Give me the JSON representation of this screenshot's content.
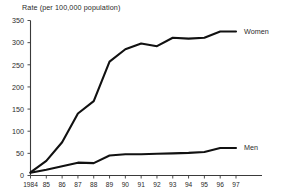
{
  "chart_data": {
    "type": "line",
    "title": "Rate (per 100,000 population)",
    "xlabel": "",
    "ylabel": "Rate (per 100,000 population)",
    "ylim": [
      0,
      350
    ],
    "grid": false,
    "legend_position": "right-inline-end-of-line",
    "categories": [
      "1984",
      "85",
      "86",
      "87",
      "88",
      "89",
      "90",
      "91",
      "92",
      "93",
      "94",
      "95",
      "96",
      "97"
    ],
    "x": [
      1984,
      1985,
      1986,
      1987,
      1988,
      1989,
      1990,
      1991,
      1992,
      1993,
      1994,
      1995,
      1996,
      1997
    ],
    "yticks": [
      0,
      50,
      100,
      150,
      200,
      250,
      300,
      350
    ],
    "series": [
      {
        "name": "Women",
        "values": [
          7,
          33,
          75,
          140,
          168,
          257,
          285,
          298,
          292,
          311,
          309,
          311,
          325,
          325
        ]
      },
      {
        "name": "Men",
        "values": [
          6,
          13,
          21,
          29,
          28,
          45,
          48,
          48,
          49,
          50,
          51,
          53,
          62,
          62
        ]
      }
    ]
  },
  "labels": {
    "women": "Women",
    "men": "Men",
    "title": "Rate (per 100,000 population)"
  }
}
